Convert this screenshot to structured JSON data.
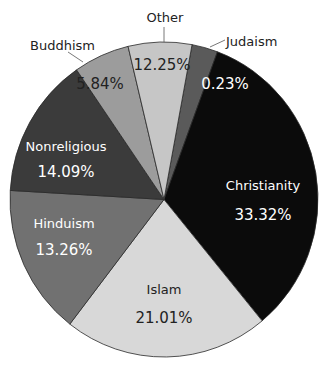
{
  "chart_data": {
    "type": "pie",
    "title": "",
    "start_angle_deg": 10.5,
    "direction": "clockwise",
    "slices": [
      {
        "label": "Judaism",
        "value": 0.23,
        "value_label": "0.23%",
        "color": "#5a5a5a",
        "text_color": "#ffffff",
        "label_outside": true
      },
      {
        "label": "Christianity",
        "value": 33.32,
        "value_label": "33.32%",
        "color": "#0b0b0b",
        "text_color": "#ffffff",
        "label_outside": false
      },
      {
        "label": "Islam",
        "value": 21.01,
        "value_label": "21.01%",
        "color": "#d8d8d8",
        "text_color": "#222222",
        "label_outside": false
      },
      {
        "label": "Hinduism",
        "value": 13.26,
        "value_label": "13.26%",
        "color": "#717171",
        "text_color": "#ffffff",
        "label_outside": false
      },
      {
        "label": "Nonreligious",
        "value": 14.09,
        "value_label": "14.09%",
        "color": "#3b3b3b",
        "text_color": "#ffffff",
        "label_outside": false
      },
      {
        "label": "Buddhism",
        "value": 5.84,
        "value_label": "5.84%",
        "color": "#9c9c9c",
        "text_color": "#222222",
        "label_outside": true
      },
      {
        "label": "Other",
        "value": 12.25,
        "value_label": "12.25%",
        "color": "#c6c6c6",
        "text_color": "#222222",
        "label_outside": true
      }
    ],
    "drawn_angles_deg": [
      [
        10.5,
        20.3
      ],
      [
        20.3,
        140.4
      ],
      [
        140.4,
        217.7
      ],
      [
        217.7,
        273.3
      ],
      [
        273.3,
        325.4
      ],
      [
        325.4,
        346.5
      ],
      [
        346.5,
        370.5
      ]
    ],
    "legend": "none"
  },
  "layout": {
    "cx": 164,
    "cy": 199.5,
    "rx": 154,
    "ry": 157.5,
    "inner_labels": [
      {
        "name": "Judaism",
        "value_xy": [
          225,
          84
        ]
      },
      {
        "name": "Christianity",
        "name_xy": [
          263,
          186
        ],
        "value_xy": [
          263,
          215
        ]
      },
      {
        "name": "Islam",
        "name_xy": [
          164,
          290
        ],
        "value_xy": [
          164,
          318
        ]
      },
      {
        "name": "Hinduism",
        "name_xy": [
          64,
          224
        ],
        "value_xy": [
          64,
          250
        ]
      },
      {
        "name": "Nonreligious",
        "name_xy": [
          66,
          147
        ],
        "value_xy": [
          66,
          172
        ]
      },
      {
        "name": "Buddhism",
        "value_xy": [
          100,
          84
        ]
      },
      {
        "name": "Other",
        "value_xy": [
          162,
          65
        ]
      }
    ],
    "outer_labels": [
      {
        "name": "Other",
        "text_xy": [
          165,
          22
        ],
        "line": [
          [
            164,
            27
          ],
          [
            164,
            42
          ]
        ],
        "anchor": "middle"
      },
      {
        "name": "Buddhism",
        "text_xy": [
          30,
          50
        ],
        "line": [
          [
            68,
            52
          ],
          [
            83,
            62
          ]
        ],
        "anchor": "start"
      },
      {
        "name": "Judaism",
        "text_xy": [
          226,
          46
        ],
        "line": [
          [
            210,
            47
          ],
          [
            225,
            40
          ]
        ],
        "anchor": "start"
      }
    ]
  }
}
